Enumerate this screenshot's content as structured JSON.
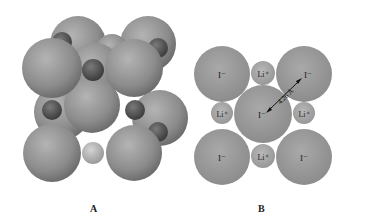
{
  "panels": [
    {
      "id": "A",
      "label": "A",
      "description": "3D space-filling model of LiI rock-salt unit cell"
    },
    {
      "id": "B",
      "label": "B",
      "description": "2D cross-section of LiI lattice",
      "large_ion_label": "I⁻",
      "small_ion_label": "Li⁺",
      "distance_label": "4.26 Å"
    }
  ],
  "colors": {
    "large_ion": "#8f8f8f",
    "small_ion_dark": "#5a5a5a",
    "small_ion_light": "#b0b0b0",
    "background": "#ffffff"
  }
}
